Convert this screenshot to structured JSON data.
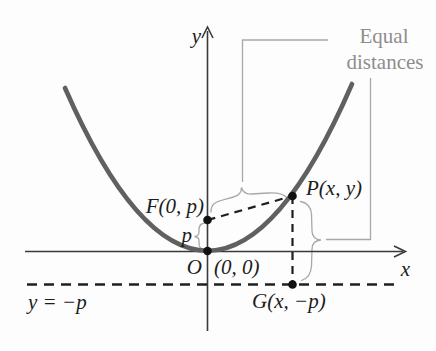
{
  "figure": {
    "labels": {
      "y_axis": "y",
      "x_axis": "x",
      "focus": "F(0, p)",
      "p_distance": "p",
      "origin": "O",
      "origin_coords": "(0, 0)",
      "point_p": "P(x, y)",
      "point_g": "G(x, −p)",
      "directrix": "y = −p",
      "equal_distances_line1": "Equal",
      "equal_distances_line2": "distances"
    },
    "colors": {
      "parabola": "#606060",
      "axis": "#3a3a3a",
      "dashed_line": "#1f1f1f",
      "dot": "#111111",
      "annotation": "#a8a8a8",
      "annotation_text": "#8d8d8d",
      "background": "#fdfdfd"
    }
  }
}
